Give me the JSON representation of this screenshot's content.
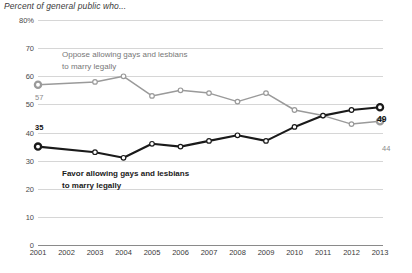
{
  "chart_data": {
    "type": "line",
    "title": "Percent of general public who...",
    "xlabel": "",
    "ylabel": "",
    "ylim": [
      0,
      80
    ],
    "ytick_labels": [
      "80%",
      "70",
      "60",
      "50",
      "40",
      "30",
      "20",
      "10",
      "0"
    ],
    "ytick_values": [
      80,
      70,
      60,
      50,
      40,
      30,
      20,
      10,
      0
    ],
    "grid": true,
    "legend_position": "inline-annotations",
    "x": [
      2001,
      2002,
      2003,
      2004,
      2005,
      2006,
      2007,
      2008,
      2009,
      2010,
      2011,
      2012,
      2013
    ],
    "tick_labels": [
      "2001",
      "2002",
      "2003",
      "2004",
      "2005",
      "2006",
      "2007",
      "2008",
      "2009",
      "2010",
      "2011",
      "2012",
      "2013"
    ],
    "series": [
      {
        "name": "Oppose allowing gays and lesbians to marry legally",
        "color": "#9a9a9a",
        "values": [
          57,
          null,
          58,
          60,
          53,
          55,
          54,
          51,
          54,
          48,
          46,
          43,
          44
        ],
        "endpoint_label": "44",
        "start_label": "57"
      },
      {
        "name": "Favor allowing gays and lesbians to marry legally",
        "color": "#1a1a1a",
        "values": [
          35,
          null,
          33,
          31,
          36,
          35,
          37,
          39,
          37,
          42,
          46,
          48,
          49
        ],
        "endpoint_label": "49",
        "start_label": "35"
      }
    ],
    "annotations": [
      {
        "text": "Oppose allowing gays and lesbians",
        "role": "legend-oppose-line1"
      },
      {
        "text": "to marry legally",
        "role": "legend-oppose-line2"
      },
      {
        "text": "Favor allowing gays and lesbians",
        "role": "legend-favor-line1"
      },
      {
        "text": "to marry legally",
        "role": "legend-favor-line2"
      }
    ]
  },
  "labels": {
    "oppose_l1": "Oppose allowing gays and lesbians",
    "oppose_l2": "to marry legally",
    "favor_l1": "Favor allowing gays and lesbians",
    "favor_l2": "to marry legally",
    "gray_start": "57",
    "gray_end": "44",
    "black_start": "35",
    "black_end": "49"
  },
  "source_note": ""
}
